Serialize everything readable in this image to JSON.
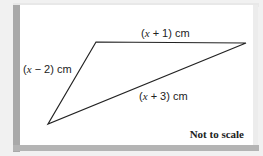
{
  "diagram": {
    "type": "triangle",
    "vertices": {
      "A": [
        96,
        42
      ],
      "B": [
        246,
        43
      ],
      "C": [
        48,
        124
      ]
    },
    "sides": [
      {
        "id": "AB",
        "label": "(x + 1) cm",
        "var": "x",
        "op": "+ 1) cm"
      },
      {
        "id": "CA",
        "label": "(x − 2) cm",
        "var": "x",
        "op": "− 2) cm"
      },
      {
        "id": "CB",
        "label": "(x + 3) cm",
        "var": "x",
        "op": "+ 3) cm"
      }
    ],
    "note": "Not to scale"
  },
  "colors": {
    "line": "#222222",
    "panel": "#ffffff",
    "shade": "#a9a9a9"
  }
}
